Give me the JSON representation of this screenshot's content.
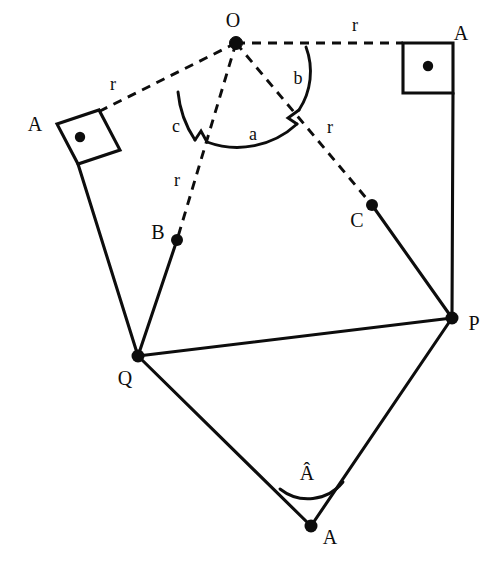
{
  "figure": {
    "background_color": "#ffffff",
    "ink_color": "#0d0d0d",
    "width": 503,
    "height": 576
  },
  "points": {
    "O": {
      "label": "O",
      "x": 236,
      "y": 43,
      "label_x": 233,
      "label_y": 22
    },
    "B": {
      "label": "B",
      "x": 177,
      "y": 240,
      "label_x": 158,
      "label_y": 234
    },
    "C": {
      "label": "C",
      "x": 372,
      "y": 205,
      "label_x": 357,
      "label_y": 222
    },
    "P": {
      "label": "P",
      "x": 452,
      "y": 318,
      "label_x": 474,
      "label_y": 325
    },
    "Q": {
      "label": "Q",
      "x": 138,
      "y": 356,
      "label_x": 125,
      "label_y": 380
    },
    "A_bottom": {
      "label": "A",
      "x": 311,
      "y": 526,
      "label_x": 330,
      "label_y": 539
    },
    "A_left": {
      "label": "A",
      "x": 80,
      "y": 137,
      "label_x": 35,
      "label_y": 126
    },
    "A_right": {
      "label": "A",
      "x": 428,
      "y": 66,
      "label_x": 461,
      "label_y": 35
    }
  },
  "radius_labels": [
    {
      "name": "r-left",
      "text": "r",
      "x": 113,
      "y": 86
    },
    {
      "name": "r-top",
      "text": "r",
      "x": 355,
      "y": 27
    },
    {
      "name": "r-right",
      "text": "r",
      "x": 330,
      "y": 129
    },
    {
      "name": "r-lower-left",
      "text": "r",
      "x": 177,
      "y": 182
    }
  ],
  "angle_labels": [
    {
      "name": "angle-a",
      "text": "a",
      "x": 253,
      "y": 136
    },
    {
      "name": "angle-b",
      "text": "b",
      "x": 298,
      "y": 80
    },
    {
      "name": "angle-c",
      "text": "c",
      "x": 176,
      "y": 128
    },
    {
      "name": "angle-A-hat",
      "text": "Â",
      "x": 307,
      "y": 475
    }
  ],
  "squares": [
    {
      "name": "square-left",
      "label": "A",
      "dot_x": 80,
      "dot_y": 137,
      "points": "57,124 99,110 120,150 78,164"
    },
    {
      "name": "square-right",
      "label": "A",
      "dot_x": 428,
      "dot_y": 66,
      "points": "403,43 453,43 453,93 403,93"
    }
  ],
  "solid_edges": [
    {
      "name": "edge-square-left-to-Q",
      "d": "M 78,164 L 138,356"
    },
    {
      "name": "edge-B-to-Q",
      "d": "M 177,240 L 138,356"
    },
    {
      "name": "edge-Q-to-P",
      "d": "M 138,356 L 452,318"
    },
    {
      "name": "edge-C-to-P",
      "d": "M 372,205 L 452,318"
    },
    {
      "name": "edge-square-right-to-P",
      "d": "M 453,93 L 452,318"
    },
    {
      "name": "edge-Q-to-A-bottom",
      "d": "M 138,356 L 311,526"
    },
    {
      "name": "edge-A-bottom-to-P",
      "d": "M 311,526 L 452,318"
    }
  ],
  "dashed_edges": [
    {
      "name": "radius-O-to-square-left",
      "d": "M 236,43 L 88,117"
    },
    {
      "name": "radius-O-to-square-right",
      "d": "M 236,43 L 403,43"
    },
    {
      "name": "radius-O-to-B",
      "d": "M 236,43 L 177,240"
    },
    {
      "name": "radius-O-to-C",
      "d": "M 236,43 L 372,205"
    }
  ],
  "angle_arcs": [
    {
      "name": "arc-c",
      "d": "M 181,95 A 100,100 0 0 0 196,141",
      "stagger": "M 196,141 L 201,133 L 206,143"
    },
    {
      "name": "arc-a",
      "d": "M 206,143 A 85,85 0 0 0 296,123",
      "stagger": "M 296,123 L 289,118 L 298,112"
    },
    {
      "name": "arc-b",
      "d": "M 298,112 A 72,72 0 0 0 306,48",
      "stagger": ""
    },
    {
      "name": "arc-A-hat",
      "d": "M 283,487 A 42,42 0 0 0 343,483"
    }
  ],
  "interaction": {
    "canvas_name": "geometry-canvas"
  }
}
